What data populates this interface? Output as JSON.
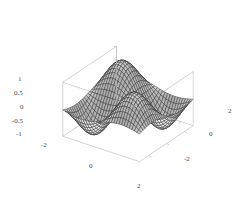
{
  "figure": {
    "kind": "surface-plot-3d",
    "background_color": "#ffffff",
    "frame_color": "#b4b4b4",
    "mesh_color": "#2a2a2a",
    "surface_light_color": "#f2f2f2",
    "surface_dark_color": "#7d7d7d",
    "tick_label_color": "#4a4a4a"
  },
  "chart_data": {
    "type": "surface",
    "title": "",
    "xlabel": "",
    "ylabel": "",
    "zlabel": "",
    "grid": false,
    "legend": "none",
    "function": "sin(x) * sin(y)",
    "xlim": [
      -3,
      3
    ],
    "ylim": [
      -3,
      3
    ],
    "zlim": [
      -1,
      1
    ],
    "x_ticks": [
      -2,
      0,
      2
    ],
    "x_tick_labels": [
      "-2",
      "0",
      "2"
    ],
    "y_ticks": [
      2,
      0,
      -2
    ],
    "y_tick_labels": [
      "2",
      "0",
      "-2"
    ],
    "z_ticks": [
      1,
      0.5,
      0,
      -0.5,
      -1
    ],
    "z_tick_labels": [
      "1",
      "0.5",
      "0",
      "-0.5",
      "-1"
    ],
    "mesh_samples_x": 30,
    "mesh_samples_y": 30,
    "view": {
      "azimuth_deg": 35,
      "elevation_deg": 28
    },
    "z_values_note": "surface heights computed as sin(x)*sin(y) over the stated xlim/ylim grid"
  },
  "axes": {
    "z_axis": {
      "name": "vertical-axis",
      "ticks": [
        {
          "label": "1",
          "value": 1,
          "x": 18,
          "y": 76
        },
        {
          "label": "0.5",
          "value": 0.5,
          "x": 14,
          "y": 90
        },
        {
          "label": "0",
          "value": 0,
          "x": 20,
          "y": 104
        },
        {
          "label": "-0.5",
          "value": -0.5,
          "x": 12,
          "y": 118
        },
        {
          "label": "-1",
          "value": -1,
          "x": 16,
          "y": 131
        }
      ]
    },
    "x_axis": {
      "name": "front-left-axis",
      "ticks": [
        {
          "label": "-2",
          "value": -2,
          "x": 41,
          "y": 142
        },
        {
          "label": "0",
          "value": 0,
          "x": 89,
          "y": 163
        },
        {
          "label": "2",
          "value": 2,
          "x": 137,
          "y": 183
        }
      ]
    },
    "y_axis": {
      "name": "front-right-axis",
      "ticks": [
        {
          "label": "2",
          "value": 2,
          "x": 228,
          "y": 108
        },
        {
          "label": "0",
          "value": 0,
          "x": 209,
          "y": 131
        },
        {
          "label": "-2",
          "value": -2,
          "x": 184,
          "y": 156
        }
      ]
    }
  }
}
